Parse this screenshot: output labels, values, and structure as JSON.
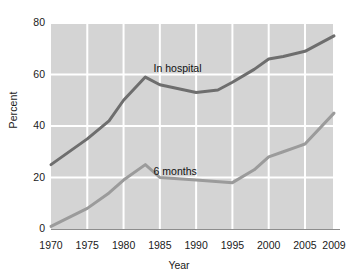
{
  "chart_data": {
    "type": "line",
    "title": "",
    "xlabel": "Year",
    "ylabel": "Percent",
    "xlim": [
      1970,
      2009
    ],
    "ylim": [
      0,
      80
    ],
    "ytick_labels": [
      "80",
      "60",
      "40",
      "20",
      "0"
    ],
    "ytick_values": [
      80,
      60,
      40,
      20,
      0
    ],
    "xtick_labels": [
      "1970",
      "1975",
      "1980",
      "1985",
      "1990",
      "1995",
      "2000",
      "2005",
      "2009"
    ],
    "xtick_values": [
      1970,
      1975,
      1980,
      1985,
      1990,
      1995,
      2000,
      2005,
      2009
    ],
    "grid": true,
    "grid_color": "#ffffff",
    "plot_background": "#d4d4d4",
    "legend": "inline-labels",
    "series": [
      {
        "name": "In hospital",
        "color": "#6e6e6e",
        "label_x": 1988,
        "label_y": 62,
        "x": [
          1970,
          1975,
          1978,
          1980,
          1983,
          1985,
          1990,
          1993,
          1995,
          1998,
          2000,
          2002,
          2005,
          2009
        ],
        "values": [
          25,
          35,
          42,
          50,
          59,
          56,
          53,
          54,
          57,
          62,
          66,
          67,
          69,
          75
        ]
      },
      {
        "name": "6 months",
        "color": "#9b9b9b",
        "label_x": 1988,
        "label_y": 22,
        "x": [
          1970,
          1975,
          1978,
          1980,
          1983,
          1985,
          1990,
          1995,
          1998,
          2000,
          2002,
          2004,
          2005,
          2009
        ],
        "values": [
          1,
          8,
          14,
          19,
          25,
          20,
          19,
          18,
          23,
          28,
          30,
          32,
          33,
          45
        ]
      }
    ]
  },
  "axes": {
    "y_title": "Percent",
    "x_title": "Year"
  }
}
